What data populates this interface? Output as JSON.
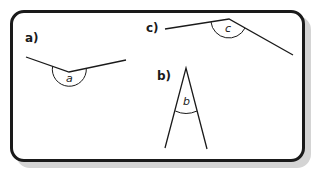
{
  "figure": {
    "angles": [
      {
        "label": "a)",
        "angle_name": "a"
      },
      {
        "label": "b)",
        "angle_name": "b"
      },
      {
        "label": "c)",
        "angle_name": "c"
      }
    ]
  },
  "colors": {
    "stroke": "#1a1a1a",
    "shadow": "#d4d4d4",
    "background": "#ffffff"
  }
}
